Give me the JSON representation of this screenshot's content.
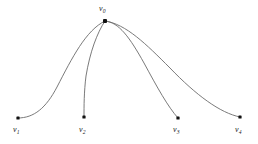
{
  "figure": {
    "type": "graph-diagram",
    "background_color": "#ffffff",
    "edge_color": "#6b6b6b",
    "node_color": "#111111",
    "label_color": "#1a1a1a",
    "width": 258,
    "height": 144
  },
  "nodes": [
    {
      "id": "v0",
      "label": "v",
      "subscript": "0",
      "x": 105,
      "y": 21,
      "size": 4.0,
      "label_x": 99,
      "label_y": 5,
      "role": "hub"
    },
    {
      "id": "v1",
      "label": "v",
      "subscript": "1",
      "x": 18,
      "y": 118,
      "size": 3.2,
      "label_x": 13,
      "label_y": 126,
      "role": "leaf"
    },
    {
      "id": "v2",
      "label": "v",
      "subscript": "2",
      "x": 84,
      "y": 117,
      "size": 3.2,
      "label_x": 79,
      "label_y": 126,
      "role": "leaf"
    },
    {
      "id": "v3",
      "label": "v",
      "subscript": "3",
      "x": 178,
      "y": 118,
      "size": 3.2,
      "label_x": 173,
      "label_y": 126,
      "role": "leaf"
    },
    {
      "id": "v4",
      "label": "v",
      "subscript": "4",
      "x": 240,
      "y": 117,
      "size": 3.2,
      "label_x": 235,
      "label_y": 126,
      "role": "leaf"
    }
  ],
  "edges": [
    {
      "id": "edge-v0-v1",
      "from": "v0",
      "to": "v1",
      "path": "M 105 21 C 86 30 72 58 57 87 C 46 108 34 118 18 118"
    },
    {
      "id": "edge-v0-v2",
      "from": "v0",
      "to": "v2",
      "path": "M 105 21 C 97 33 90 52 86 76 C 84 92 84 106 84 117"
    },
    {
      "id": "edge-v0-v3",
      "from": "v0",
      "to": "v3",
      "path": "M 105 21 C 119 22 130 38 144 63 C 157 87 168 107 178 118"
    },
    {
      "id": "edge-v0-v4",
      "from": "v0",
      "to": "v4",
      "path": "M 105 21 C 126 24 146 44 170 68 C 196 95 220 113 240 117"
    }
  ]
}
